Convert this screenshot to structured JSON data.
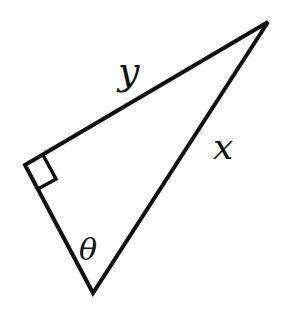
{
  "diagram": {
    "type": "right-triangle",
    "labels": {
      "hypotenuse_upper": "y",
      "side_right": "x",
      "angle": "θ"
    },
    "right_angle_marker": true,
    "stroke_color": "#111111",
    "background": "#ffffff"
  }
}
